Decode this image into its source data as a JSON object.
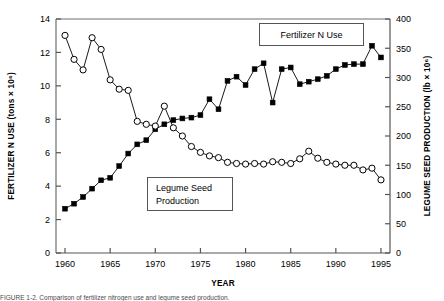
{
  "figure": {
    "caption": "FIGURE 1-2.  Comparison of fertilizer nitrogen use and legume seed production."
  },
  "chart_data": {
    "type": "line",
    "title": "",
    "xlabel": "YEAR",
    "ylabel": "FERTILIZER N USE (tons × 10⁶)",
    "y2label": "LEGUME SEED PRODUCTION (lb × 10⁶)",
    "xlim": [
      1959,
      1996
    ],
    "ylim": [
      0,
      14
    ],
    "y2lim": [
      0,
      400
    ],
    "xticks": [
      1960,
      1965,
      1970,
      1975,
      1980,
      1985,
      1990,
      1995
    ],
    "xticklabels": [
      "1960",
      "1965",
      "1970",
      "1975",
      "1980",
      "1985",
      "1990",
      "1995"
    ],
    "yticks": [
      0,
      2,
      4,
      6,
      8,
      10,
      12,
      14
    ],
    "yticklabels": [
      "0",
      "2",
      "4",
      "6",
      "8",
      "10",
      "12",
      "14"
    ],
    "y2ticks": [
      0,
      50,
      100,
      150,
      200,
      250,
      300,
      350,
      400
    ],
    "y2ticklabels": [
      "0",
      "50",
      "100",
      "150",
      "200",
      "250",
      "300",
      "350",
      "400"
    ],
    "grid": false,
    "legend_position": "inside-annotations",
    "series": [
      {
        "name": "Fertilizer N Use",
        "axis": "left",
        "marker": "filled-square",
        "color": "#000000",
        "x": [
          1960,
          1961,
          1962,
          1963,
          1964,
          1965,
          1966,
          1967,
          1968,
          1969,
          1970,
          1971,
          1972,
          1973,
          1974,
          1975,
          1976,
          1977,
          1978,
          1979,
          1980,
          1981,
          1982,
          1983,
          1984,
          1985,
          1986,
          1987,
          1988,
          1989,
          1990,
          1991,
          1992,
          1993,
          1994,
          1995
        ],
        "values": [
          2.65,
          2.95,
          3.35,
          3.85,
          4.35,
          4.5,
          5.2,
          5.95,
          6.5,
          6.75,
          7.4,
          7.7,
          7.95,
          8.05,
          8.1,
          8.25,
          9.2,
          8.6,
          10.3,
          10.55,
          10.05,
          11.0,
          11.35,
          9.0,
          11.0,
          11.1,
          10.1,
          10.25,
          10.4,
          10.6,
          11.0,
          11.25,
          11.3,
          11.3,
          12.4,
          11.7
        ]
      },
      {
        "name": "Legume Seed Production",
        "axis": "right",
        "marker": "open-circle",
        "color": "#000000",
        "x": [
          1960,
          1961,
          1962,
          1963,
          1964,
          1965,
          1966,
          1967,
          1968,
          1969,
          1970,
          1971,
          1972,
          1973,
          1974,
          1975,
          1976,
          1977,
          1978,
          1979,
          1980,
          1981,
          1982,
          1983,
          1984,
          1985,
          1986,
          1987,
          1988,
          1989,
          1990,
          1991,
          1992,
          1993,
          1994,
          1995
        ],
        "values": [
          372,
          331,
          313,
          368,
          348,
          296,
          280,
          278,
          225,
          220,
          217,
          251,
          214,
          200,
          182,
          172,
          166,
          163,
          155,
          153,
          152,
          153,
          152,
          156,
          155,
          153,
          161,
          174,
          162,
          155,
          152,
          150,
          150,
          142,
          145,
          125
        ]
      }
    ],
    "annotations": [
      {
        "text": "Fertilizer N Use",
        "x": 1981,
        "boxed": true
      },
      {
        "text": "Legume Seed\nProduction",
        "line1": "Legume Seed",
        "line2": "Production",
        "x": 1972,
        "boxed": true
      }
    ]
  }
}
